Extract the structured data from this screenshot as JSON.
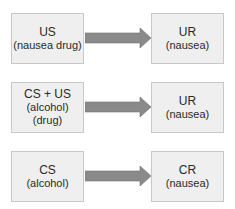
{
  "rows": [
    {
      "left": {
        "line1": "US",
        "line2": "(nausea drug)"
      },
      "right": {
        "line1": "UR",
        "line2": "(nausea)"
      }
    },
    {
      "left": {
        "line1": "CS + US",
        "line2": "(alcohol) (drug)"
      },
      "right": {
        "line1": "UR",
        "line2": "(nausea)"
      }
    },
    {
      "left": {
        "line1": "CS",
        "line2": "(alcohol)"
      },
      "right": {
        "line1": "CR",
        "line2": "(nausea)"
      }
    }
  ],
  "colors": {
    "box_fill": "#efefef",
    "box_border": "#c8c8c8",
    "arrow_fill": "#8a8a8a"
  }
}
